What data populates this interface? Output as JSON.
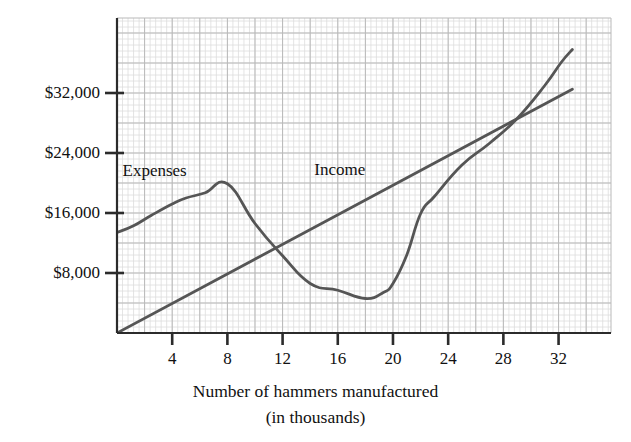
{
  "chart_data": {
    "type": "line",
    "title": "",
    "xlabel": "Number of hammers manufactured (in thousands)",
    "xlabel_line1": "Number of hammers manufactured",
    "xlabel_line2": "(in thousands)",
    "ylabel": "",
    "xlim": [
      0,
      35.8
    ],
    "ylim": [
      0,
      42000
    ],
    "grid": true,
    "grid_major_step_x": 2,
    "grid_major_step_y": 4000,
    "grid_minor_step_x": 0.4,
    "grid_minor_step_y": 800,
    "legend_position": "inline-annotations",
    "xticks": [
      4,
      8,
      12,
      16,
      20,
      24,
      28,
      32
    ],
    "xticklabels": [
      "4",
      "8",
      "12",
      "16",
      "20",
      "24",
      "28",
      "32"
    ],
    "yticks": [
      8000,
      16000,
      24000,
      32000
    ],
    "yticklabels": [
      "$8,000",
      "$16,000",
      "$24,000",
      "$32,000"
    ],
    "annotations": [
      {
        "text": "Expenses",
        "x": 0.4,
        "y": 21600
      },
      {
        "text": "Income",
        "x": 14.3,
        "y": 21800
      }
    ],
    "series": [
      {
        "name": "Income",
        "color": "#555555",
        "points": [
          {
            "x": 0,
            "y": 0
          },
          {
            "x": 33,
            "y": 32500
          }
        ]
      },
      {
        "name": "Expenses",
        "color": "#555555",
        "points": [
          {
            "x": 0,
            "y": 13400
          },
          {
            "x": 1.2,
            "y": 14300
          },
          {
            "x": 2.5,
            "y": 15700
          },
          {
            "x": 4,
            "y": 17200
          },
          {
            "x": 5,
            "y": 18000
          },
          {
            "x": 6.4,
            "y": 18700
          },
          {
            "x": 8,
            "y": 19900
          },
          {
            "x": 10,
            "y": 14600
          },
          {
            "x": 12,
            "y": 10300
          },
          {
            "x": 14,
            "y": 6600
          },
          {
            "x": 16,
            "y": 5700
          },
          {
            "x": 18,
            "y": 4600
          },
          {
            "x": 19.3,
            "y": 5400
          },
          {
            "x": 20,
            "y": 6600
          },
          {
            "x": 21,
            "y": 10400
          },
          {
            "x": 22,
            "y": 15900
          },
          {
            "x": 23,
            "y": 18200
          },
          {
            "x": 25,
            "y": 22400
          },
          {
            "x": 27,
            "y": 25300
          },
          {
            "x": 29,
            "y": 28600
          },
          {
            "x": 31,
            "y": 33000
          },
          {
            "x": 32.2,
            "y": 36100
          },
          {
            "x": 33,
            "y": 37800
          }
        ]
      }
    ],
    "colors": {
      "line": "#555555",
      "axis": "#2b2b2b",
      "grid_major": "#b9b9b9",
      "grid_minor": "#dddddd",
      "text": "#111111",
      "background": "#ffffff"
    }
  }
}
